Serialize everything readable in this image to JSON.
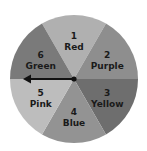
{
  "spinner": {
    "center": [
      74,
      79
    ],
    "radius": 64,
    "sectors": [
      {
        "number": "1",
        "label": "Red",
        "color": "#b0b0b0"
      },
      {
        "number": "2",
        "label": "Purple",
        "color": "#8e8e8e"
      },
      {
        "number": "3",
        "label": "Yellow",
        "color": "#6e6e6e"
      },
      {
        "number": "4",
        "label": "Blue",
        "color": "#939393"
      },
      {
        "number": "5",
        "label": "Pink",
        "color": "#bdbdbd"
      },
      {
        "number": "6",
        "label": "Green",
        "color": "#7a7a7a"
      }
    ],
    "pointer": {
      "direction": "left",
      "color": "#111111"
    }
  }
}
